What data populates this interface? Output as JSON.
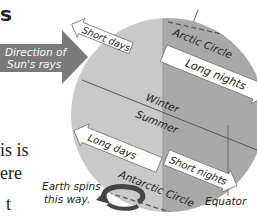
{
  "page_fragments": {
    "top_left": "s",
    "body_line1": "is is",
    "body_line2": "ere",
    "body_line3": "t"
  },
  "diagram": {
    "sun_arrow": {
      "line1": "Direction of",
      "line2": "Sun's rays",
      "color": "#7a7a7a"
    },
    "labels": {
      "arctic_circle": "Arctic Circle",
      "antarctic_circle": "Antarctic Circle",
      "winter": "Winter",
      "summer": "Summer",
      "equator": "Equator",
      "spin_line1": "Earth spins",
      "spin_line2": "this way."
    },
    "arrows": {
      "north_day": "Short days",
      "north_night": "Long nights",
      "south_day": "Long days",
      "south_night": "Short nights"
    },
    "colors": {
      "day_side": "#c9c9c9",
      "night_side": "#a9a9a9",
      "arrow_fill": "#ffffff",
      "line": "#555555"
    }
  }
}
